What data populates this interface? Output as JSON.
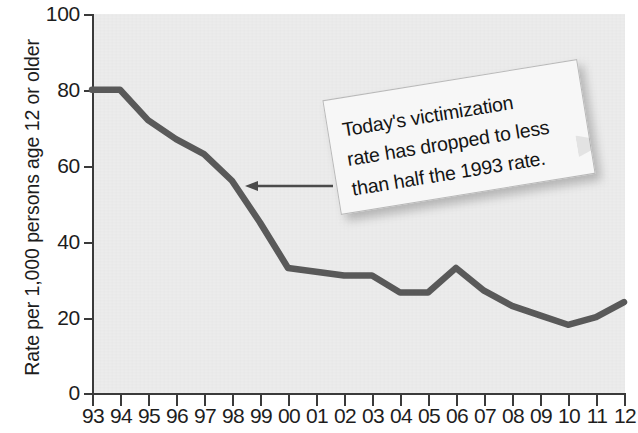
{
  "chart_data": {
    "type": "line",
    "title": "",
    "subtitle": "",
    "xlabel": "",
    "ylabel": "Rate per 1,000 persons age 12 or older",
    "categories": [
      "93",
      "94",
      "95",
      "96",
      "97",
      "98",
      "99",
      "00",
      "01",
      "02",
      "03",
      "04",
      "05",
      "06",
      "07",
      "08",
      "09",
      "10",
      "11",
      "12"
    ],
    "x_full_years": [
      1993,
      1994,
      1995,
      1996,
      1997,
      1998,
      1999,
      2000,
      2001,
      2002,
      2003,
      2004,
      2005,
      2006,
      2007,
      2008,
      2009,
      2010,
      2011,
      2012
    ],
    "values": [
      80,
      80,
      72,
      67,
      63,
      56,
      45,
      33,
      32,
      31,
      31,
      26.5,
      26.5,
      33,
      27,
      23,
      20.5,
      18,
      20,
      24
    ],
    "series": [
      {
        "name": "Violent victimization rate",
        "values": [
          80,
          80,
          72,
          67,
          63,
          56,
          45,
          33,
          32,
          31,
          31,
          26.5,
          26.5,
          33,
          27,
          23,
          20.5,
          18,
          20,
          24
        ]
      }
    ],
    "ylim": [
      0,
      100
    ],
    "yticks": [
      0,
      20,
      40,
      60,
      80,
      100
    ],
    "ytick_labels": [
      "0",
      "20",
      "40",
      "60",
      "80",
      "100"
    ],
    "xlim_labels": [
      "93",
      "12"
    ],
    "grid": false,
    "legend": "none",
    "line_color": "#595959",
    "plot_background": "#ececec",
    "annotations": [
      {
        "name": "callout",
        "text": "Today's victimization rate has dropped to less than half the 1993 rate.",
        "lines": [
          "Today's victimization",
          "rate has dropped to less",
          "than half the 1993 rate."
        ],
        "arrow": "points-left-to-line-near-1998"
      }
    ]
  },
  "axis": {
    "y_title": "Rate per 1,000 persons age 12 or older",
    "y_ticks": [
      "100",
      "80",
      "60",
      "40",
      "20",
      "0"
    ],
    "x_ticks": [
      "93",
      "94",
      "95",
      "96",
      "97",
      "98",
      "99",
      "00",
      "01",
      "02",
      "03",
      "04",
      "05",
      "06",
      "07",
      "08",
      "09",
      "10",
      "11",
      "12"
    ]
  },
  "callout": {
    "line1": "Today's victimization",
    "line2": "rate has dropped to less",
    "line3": "than half the 1993 rate."
  },
  "colors": {
    "line": "#595959",
    "axis": "#3a3a3a",
    "plot_bg": "#ececec",
    "text": "#1d1d1d"
  }
}
